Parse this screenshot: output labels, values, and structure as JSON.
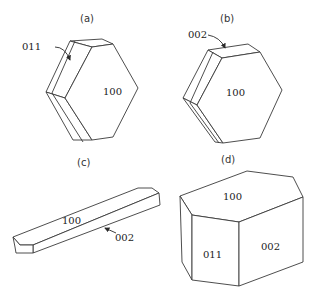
{
  "figure": {
    "panels": [
      {
        "id": "a",
        "caption": "(a)",
        "shape": "thin hexagonal plate",
        "face_labels": {
          "front": "100",
          "pointer": "011"
        }
      },
      {
        "id": "b",
        "caption": "(b)",
        "shape": "thin hexagonal plate",
        "face_labels": {
          "front": "100",
          "pointer": "002"
        }
      },
      {
        "id": "c",
        "caption": "(c)",
        "shape": "elongated lath / needle",
        "face_labels": {
          "top": "100",
          "pointer": "002"
        }
      },
      {
        "id": "d",
        "caption": "(d)",
        "shape": "prismatic block",
        "face_labels": {
          "top": "100",
          "left": "011",
          "right": "002"
        }
      }
    ]
  },
  "colors": {
    "line": "#3a3a3a",
    "background": "#ffffff",
    "text": "#222222"
  }
}
